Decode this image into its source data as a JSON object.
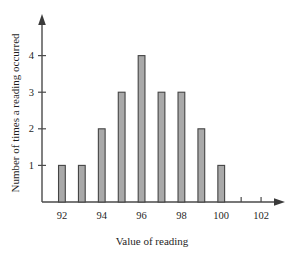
{
  "chart_data": {
    "type": "bar",
    "title": "",
    "subtitle": "",
    "xlabel": "Value of reading",
    "ylabel": "Number of times a reading occurred",
    "categories": [
      92,
      93,
      94,
      95,
      96,
      97,
      98,
      99,
      100
    ],
    "values": [
      1,
      1,
      2,
      3,
      4,
      3,
      3,
      2,
      1
    ],
    "x_tick_labels": [
      "92",
      "94",
      "96",
      "98",
      "100",
      "102"
    ],
    "x_tick_values": [
      92,
      94,
      96,
      98,
      100,
      102
    ],
    "x_minor_ticks": [
      92,
      93,
      94,
      95,
      96,
      97,
      98,
      99,
      100,
      101,
      102
    ],
    "y_tick_labels": [
      "1",
      "2",
      "3",
      "4"
    ],
    "y_tick_values": [
      1,
      2,
      3,
      4
    ],
    "xlim": [
      91.0,
      102.8
    ],
    "ylim": [
      0,
      4.7
    ],
    "grid": false,
    "legend": null,
    "bar_fill_color": "#a9a9a9",
    "bar_edge_color": "#444444",
    "axis_color": "#4a4a4a",
    "background_color": "#ffffff",
    "bar_width_units": 0.34,
    "x_axis_has_arrow": true,
    "y_axis_has_arrow": true
  },
  "labels": {
    "y_axis_title": "Number of times a reading occurred",
    "x_axis_title": "Value of reading"
  }
}
